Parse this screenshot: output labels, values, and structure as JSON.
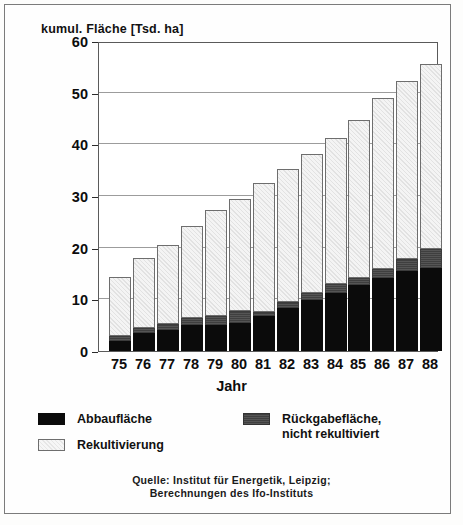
{
  "chart_data": {
    "type": "bar",
    "subtype": "stacked-vertical",
    "title": "kumul. Fläche [Tsd. ha]",
    "xlabel": "Jahr",
    "ylabel": "kumul. Fläche [Tsd. ha]",
    "ylim": [
      0,
      60
    ],
    "yticks": [
      0,
      10,
      20,
      30,
      40,
      50,
      60
    ],
    "grid": true,
    "legend_position": "below-axes",
    "categories": [
      "75",
      "76",
      "77",
      "78",
      "79",
      "80",
      "81",
      "82",
      "83",
      "84",
      "85",
      "86",
      "87",
      "88"
    ],
    "series": [
      {
        "name": "Abbaufläche",
        "color": "#0b0b0b",
        "values": [
          2.0,
          3.5,
          4.0,
          5.0,
          5.0,
          5.5,
          6.8,
          8.4,
          9.8,
          11.3,
          12.7,
          14.2,
          15.5,
          16.0
        ]
      },
      {
        "name": "Rückgabefläche,\nnicht rekultiviert",
        "color": "#4a4a4a",
        "values": [
          1.0,
          0.9,
          1.2,
          1.3,
          1.8,
          2.3,
          0.8,
          1.0,
          1.4,
          1.6,
          1.5,
          1.7,
          2.3,
          3.8
        ]
      },
      {
        "name": "Rekultivierung",
        "color": "#ececec",
        "values": [
          11.3,
          13.6,
          15.4,
          17.9,
          20.4,
          21.6,
          24.9,
          25.9,
          26.9,
          28.3,
          30.5,
          33.0,
          34.5,
          35.8
        ]
      }
    ],
    "totals": [
      14.3,
      18.0,
      20.6,
      24.2,
      27.2,
      29.4,
      32.5,
      35.3,
      38.1,
      41.2,
      44.7,
      48.9,
      52.3,
      55.6
    ]
  },
  "legend": {
    "items": [
      {
        "label": "Abbaufläche",
        "swatch": "black"
      },
      {
        "label": "Rückgabefläche,\nnicht rekultiviert",
        "swatch": "gray"
      },
      {
        "label": "Rekultivierung",
        "swatch": "light"
      }
    ]
  },
  "source": {
    "line1": "Quelle: Institut für Energetik, Leipzig;",
    "line2": "Berechnungen des Ifo-Instituts"
  }
}
